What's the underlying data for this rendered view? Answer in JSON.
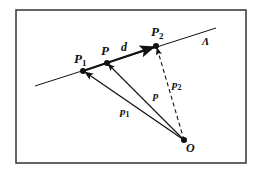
{
  "diagram": {
    "labels": {
      "p1_point": "P",
      "p1_point_sub": "1",
      "p_point": "P",
      "p2_point": "P",
      "p2_point_sub": "2",
      "direction": "d",
      "line": "Λ",
      "origin": "O",
      "vec_p1": "p",
      "vec_p1_sub": "1",
      "vec_p": "p",
      "vec_p2": "p",
      "vec_p2_sub": "2"
    },
    "colors": {
      "stroke": "#111111",
      "frame": "#333333",
      "background": "#ffffff"
    }
  }
}
